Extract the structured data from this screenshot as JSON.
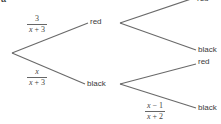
{
  "part_label": "a",
  "colors": {
    "line": "#6a6a6a",
    "text": "#3a3a3a"
  },
  "tree": {
    "first": {
      "red": {
        "label": "red",
        "prob_num": "3",
        "prob_den": "x + 3"
      },
      "black": {
        "label": "black",
        "prob_num": "x",
        "prob_den": "x + 3"
      }
    },
    "second_after_red": {
      "red": {
        "label": "red"
      },
      "black": {
        "label": "black"
      }
    },
    "second_after_black": {
      "red": {
        "label": "red"
      },
      "black": {
        "label": "black",
        "prob_num": "x − 1",
        "prob_den": "x + 2"
      }
    }
  }
}
